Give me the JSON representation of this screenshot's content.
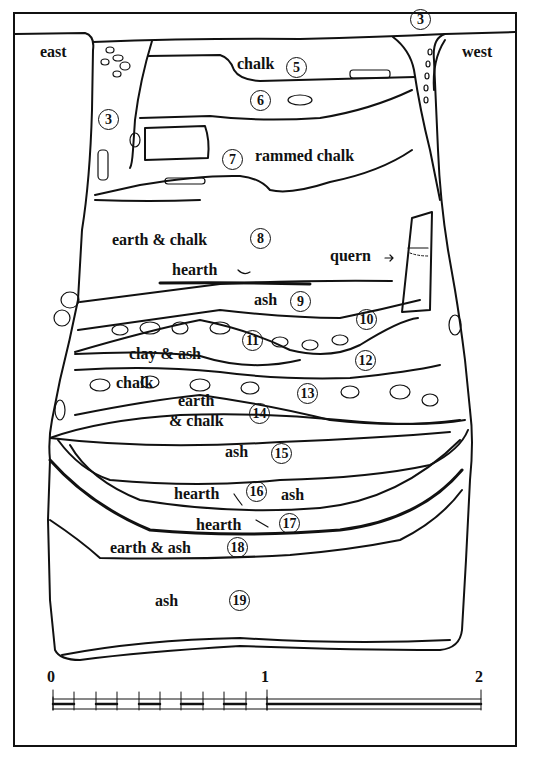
{
  "figure": {
    "type": "archaeological section drawing",
    "orientation": {
      "left": "east",
      "right": "west"
    },
    "layers": [
      {
        "number": "3",
        "label": ""
      },
      {
        "number": "5",
        "label": "chalk"
      },
      {
        "number": "6",
        "label": ""
      },
      {
        "number": "7",
        "label": "rammed chalk"
      },
      {
        "number": "8",
        "label": "earth & chalk"
      },
      {
        "number": "9",
        "label": "ash"
      },
      {
        "number": "10",
        "label": ""
      },
      {
        "number": "11",
        "label": ""
      },
      {
        "number": "12",
        "label": "clay & ash"
      },
      {
        "number": "13",
        "label": "chalk"
      },
      {
        "number": "14",
        "label": "earth & chalk"
      },
      {
        "number": "15",
        "label": "ash"
      },
      {
        "number": "16",
        "label": "ash"
      },
      {
        "number": "17",
        "label": "hearth"
      },
      {
        "number": "18",
        "label": "earth & ash"
      },
      {
        "number": "19",
        "label": "ash"
      }
    ],
    "annotations": {
      "hearth_upper": "hearth",
      "quern": "quern",
      "hearth_16": "hearth",
      "hearth_17": "hearth"
    },
    "texts": {
      "east": "east",
      "west": "west",
      "chalk_5": "chalk",
      "rammed_chalk_7": "rammed chalk",
      "earth_chalk_8": "earth & chalk",
      "hearth_arrow": "hearth",
      "quern_arrow": "quern",
      "ash_9": "ash",
      "clay_ash_12": "clay & ash",
      "chalk_13": "chalk",
      "earth_14a": "earth",
      "earth_14b": "& chalk",
      "ash_15": "ash",
      "hearth_16": "hearth",
      "ash_16": "ash",
      "hearth_17": "hearth",
      "earth_ash_18": "earth & ash",
      "ash_19": "ash"
    },
    "circled_numbers": {
      "n3a": "3",
      "n3b": "3",
      "n5": "5",
      "n6": "6",
      "n7": "7",
      "n8": "8",
      "n9": "9",
      "n10": "10",
      "n11": "11",
      "n12": "12",
      "n13": "13",
      "n14": "14",
      "n15": "15",
      "n16": "16",
      "n17": "17",
      "n18": "18",
      "n19": "19"
    },
    "scale_bar": {
      "ticks": [
        "0",
        "1",
        "2"
      ],
      "subdivisions_first_unit": 10,
      "stroke_color": "#111111"
    },
    "colors": {
      "ink": "#111111",
      "paper": "#ffffff"
    }
  }
}
